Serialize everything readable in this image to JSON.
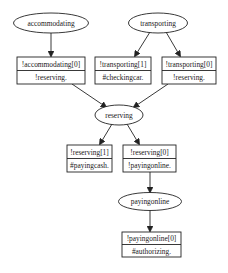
{
  "diagram": {
    "type": "directed-graph",
    "colors": {
      "stroke": "#222222",
      "fill": "#ffffff",
      "text": "#1a1a1a"
    },
    "nodes": {
      "accommodating": {
        "label": "accommodating",
        "shape": "ellipse"
      },
      "transporting": {
        "label": "transporting",
        "shape": "ellipse"
      },
      "reserving": {
        "label": "reserving",
        "shape": "ellipse"
      },
      "payingonline": {
        "label": "payingonline",
        "shape": "ellipse"
      },
      "acc0": {
        "shape": "record",
        "top": "!accommodating[0]",
        "bottom": "!reserving."
      },
      "tr1": {
        "shape": "record",
        "top": "!transporting[1]",
        "bottom": "#checkingcar."
      },
      "tr0": {
        "shape": "record",
        "top": "!transporting[0]",
        "bottom": "!reserving."
      },
      "res1": {
        "shape": "record",
        "top": "!reserving[1]",
        "bottom": "#payingcash."
      },
      "res0": {
        "shape": "record",
        "top": "!reserving[0]",
        "bottom": "!payingonline."
      },
      "pay0": {
        "shape": "record",
        "top": "!payingonline[0]",
        "bottom": "#authorizing."
      }
    },
    "edges": [
      {
        "from": "accommodating",
        "to": "acc0"
      },
      {
        "from": "transporting",
        "to": "tr1"
      },
      {
        "from": "transporting",
        "to": "tr0"
      },
      {
        "from": "acc0",
        "to": "reserving"
      },
      {
        "from": "tr0",
        "to": "reserving"
      },
      {
        "from": "reserving",
        "to": "res1"
      },
      {
        "from": "reserving",
        "to": "res0"
      },
      {
        "from": "res0",
        "to": "payingonline"
      },
      {
        "from": "payingonline",
        "to": "pay0"
      }
    ]
  }
}
